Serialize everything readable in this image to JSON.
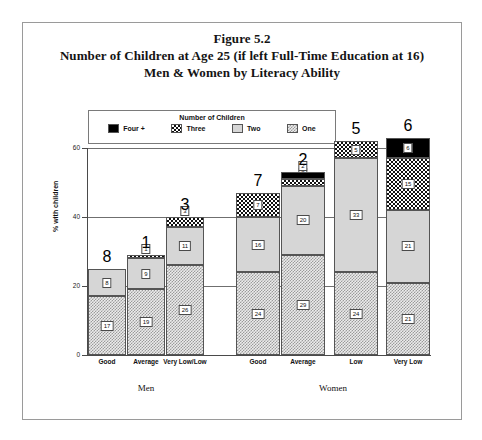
{
  "figure": {
    "title_lines": [
      "Figure 5.2",
      "Number of Children at Age 25 (if left Full-Time Education at 16)",
      "Men & Women by Literacy Ability"
    ]
  },
  "legend": {
    "title": "Number of Children",
    "items": [
      {
        "label": "Four +",
        "pattern": "solid-black",
        "color": "#000000"
      },
      {
        "label": "Three",
        "pattern": "dense-checker",
        "color": "#111111"
      },
      {
        "label": "Two",
        "pattern": "light-gray",
        "color": "#d6d6d6"
      },
      {
        "label": "One",
        "pattern": "fine-hatch",
        "color": "#ececec"
      }
    ]
  },
  "axes": {
    "ylabel": "% with children",
    "yticks": [
      "0",
      "20",
      "40",
      "60"
    ],
    "ymin": 0,
    "ymax": 60
  },
  "groups": [
    {
      "name": "Men",
      "label": "Men"
    },
    {
      "name": "Women",
      "label": "Women"
    }
  ],
  "chart_data": {
    "type": "bar",
    "subtype": "stacked-bar",
    "title": "Number of Children at Age 25 (if left Full-Time Education at 16) Men & Women by Literacy Ability",
    "figure_number": "Figure 5.2",
    "xlabel": "",
    "ylabel": "% with children",
    "ylim": [
      0,
      60
    ],
    "ytick_values": [
      0,
      20,
      40,
      60
    ],
    "grid": true,
    "legend_title": "Number of Children",
    "legend_position": "top-inside-left",
    "groups": [
      "Men",
      "Women"
    ],
    "categories": [
      "Good",
      "Average",
      "Very Low/Low",
      "Good",
      "Average",
      "Low",
      "Very Low"
    ],
    "category_groups": [
      "Men",
      "Men",
      "Men",
      "Women",
      "Women",
      "Women",
      "Women"
    ],
    "series": [
      {
        "name": "One",
        "values": [
          17,
          19,
          26,
          24,
          29,
          24,
          21
        ]
      },
      {
        "name": "Two",
        "values": [
          8,
          9,
          11,
          16,
          20,
          33,
          21
        ]
      },
      {
        "name": "Three",
        "values": [
          0,
          1,
          3,
          7,
          2,
          5,
          15
        ]
      },
      {
        "name": "Four +",
        "values": [
          0,
          0,
          0,
          0,
          2,
          0,
          6
        ]
      }
    ],
    "totals": [
      25,
      29,
      40,
      47,
      53,
      62,
      63
    ]
  },
  "bars": [
    {
      "group": "Men",
      "category": "Good",
      "x": 0,
      "width": 38,
      "segments": [
        {
          "series": "One",
          "value": 17,
          "label": "17"
        },
        {
          "series": "Two",
          "value": 8,
          "label": "8"
        }
      ]
    },
    {
      "group": "Men",
      "category": "Average",
      "x": 39,
      "width": 38,
      "segments": [
        {
          "series": "One",
          "value": 19,
          "label": "19"
        },
        {
          "series": "Two",
          "value": 9,
          "label": "9"
        },
        {
          "series": "Three",
          "value": 1,
          "label": "1"
        }
      ]
    },
    {
      "group": "Men",
      "category": "Very Low/Low",
      "x": 78,
      "width": 38,
      "segments": [
        {
          "series": "One",
          "value": 26,
          "label": "26"
        },
        {
          "series": "Two",
          "value": 11,
          "label": "11"
        },
        {
          "series": "Three",
          "value": 3,
          "label": "3"
        }
      ]
    },
    {
      "group": "Women",
      "category": "Good",
      "x": 148,
      "width": 44,
      "segments": [
        {
          "series": "One",
          "value": 24,
          "label": "24"
        },
        {
          "series": "Two",
          "value": 16,
          "label": "16"
        },
        {
          "series": "Three",
          "value": 7,
          "label": "7"
        }
      ]
    },
    {
      "group": "Women",
      "category": "Average",
      "x": 193,
      "width": 44,
      "segments": [
        {
          "series": "One",
          "value": 29,
          "label": "29"
        },
        {
          "series": "Two",
          "value": 20,
          "label": "20"
        },
        {
          "series": "Three",
          "value": 2,
          "label": "2"
        },
        {
          "series": "Four +",
          "value": 2,
          "label": "2"
        }
      ]
    },
    {
      "group": "Women",
      "category": "Low",
      "x": 246,
      "width": 44,
      "segments": [
        {
          "series": "One",
          "value": 24,
          "label": "24"
        },
        {
          "series": "Two",
          "value": 33,
          "label": "33"
        },
        {
          "series": "Three",
          "value": 5,
          "label": "5"
        }
      ]
    },
    {
      "group": "Women",
      "category": "Very Low",
      "x": 298,
      "width": 44,
      "segments": [
        {
          "series": "One",
          "value": 21,
          "label": "21"
        },
        {
          "series": "Two",
          "value": 21,
          "label": "21"
        },
        {
          "series": "Three",
          "value": 15,
          "label": "15"
        },
        {
          "series": "Four +",
          "value": 6,
          "label": "6"
        }
      ]
    }
  ]
}
